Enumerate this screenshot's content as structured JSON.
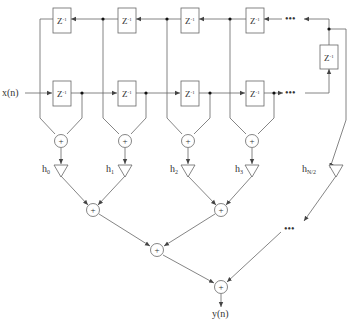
{
  "diagram": {
    "input_label": "x(n)",
    "output_label": "y(n)",
    "delay_label": "Z",
    "delay_exp": "-1",
    "adder_symbol": "+",
    "ellipsis": "•••",
    "coefficients": [
      {
        "base": "h",
        "sub": "0"
      },
      {
        "base": "h",
        "sub": "1"
      },
      {
        "base": "h",
        "sub": "2"
      },
      {
        "base": "h",
        "sub": "3"
      },
      {
        "base": "h",
        "sub": "N/2"
      }
    ],
    "colors": {
      "line": "#555555",
      "box": "#666666",
      "node": "#111111",
      "background": "#ffffff"
    }
  }
}
